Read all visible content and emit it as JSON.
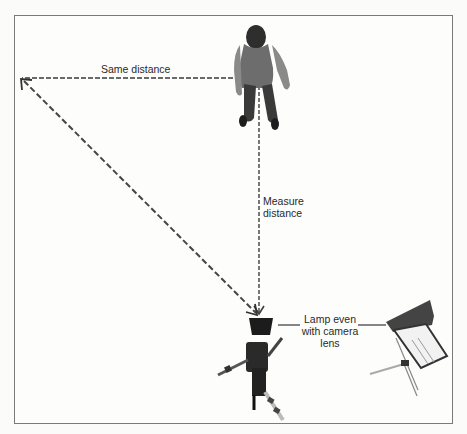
{
  "diagram": {
    "labels": {
      "same_distance": "Same distance",
      "measure_distance_line1": "Measure",
      "measure_distance_line2": "distance",
      "lamp_line1": "Lamp even",
      "lamp_line2": "with camera",
      "lamp_line3": "lens"
    },
    "elements": {
      "subject": "person-standing-top-view",
      "camera": "camera-on-tripod-top-view",
      "lamp": "lamp-on-stand-top-view"
    },
    "colors": {
      "dash_line": "#6a6a6a",
      "arrow": "#3c3c3c",
      "frame": "#7a7a7a",
      "text": "#2a2a2a"
    }
  }
}
